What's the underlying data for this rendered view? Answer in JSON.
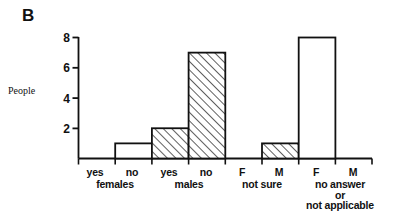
{
  "panel": {
    "letter": "B"
  },
  "axis": {
    "y_title": "People",
    "y_ticks": [
      "8",
      "6",
      "4",
      "2"
    ],
    "y_tick_values": [
      8,
      6,
      4,
      2
    ]
  },
  "categories": [
    {
      "label": "yes"
    },
    {
      "label": "no"
    },
    {
      "label": "yes"
    },
    {
      "label": "no"
    },
    {
      "label": "F"
    },
    {
      "label": "M"
    },
    {
      "label": "F"
    },
    {
      "label": "M"
    }
  ],
  "groups": [
    {
      "lines": [
        "females"
      ]
    },
    {
      "lines": [
        "males"
      ]
    },
    {
      "lines": [
        "not sure"
      ]
    },
    {
      "lines": [
        "no answer",
        "or",
        "not applicable"
      ]
    }
  ],
  "chart_data": {
    "type": "bar",
    "title": "B",
    "xlabel": "",
    "ylabel": "People",
    "ylim": [
      0,
      8
    ],
    "grid": false,
    "legend": "none",
    "categories": [
      "yes",
      "no",
      "yes",
      "no",
      "F",
      "M",
      "F",
      "M"
    ],
    "group_labels": [
      "females",
      "females",
      "males",
      "males",
      "not sure",
      "not sure",
      "no answer or not applicable",
      "no answer or not applicable"
    ],
    "values": [
      0,
      1,
      2,
      7,
      0,
      1,
      8,
      0
    ],
    "fills": [
      "none",
      "solid-white",
      "hatched",
      "hatched",
      "none",
      "hatched",
      "solid-white",
      "none"
    ],
    "ytick_labels": [
      "2",
      "4",
      "6",
      "8"
    ],
    "ytick_values": [
      2,
      4,
      6,
      8
    ]
  },
  "colors": {
    "ink": "#111111",
    "background": "#ffffff",
    "hatch": "#2b2b2b"
  }
}
